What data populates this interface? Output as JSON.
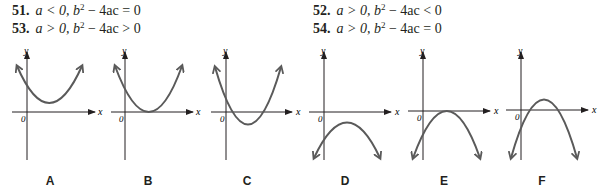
{
  "problems": [
    {
      "id": "p51",
      "number": "51.",
      "a_cond": "a < 0,",
      "disc": "b",
      "disc_rest": " − 4ac = 0"
    },
    {
      "id": "p52",
      "number": "52.",
      "a_cond": "a > 0,",
      "disc": "b",
      "disc_rest": " − 4ac < 0"
    },
    {
      "id": "p53",
      "number": "53.",
      "a_cond": "a > 0,",
      "disc": "b",
      "disc_rest": " − 4ac > 0"
    },
    {
      "id": "p54",
      "number": "54.",
      "a_cond": "a > 0,",
      "disc": "b",
      "disc_rest": " − 4ac = 0"
    }
  ],
  "graphs": [
    {
      "label": "A",
      "description": "opens upward, vertex above x-axis, no x-intercepts"
    },
    {
      "label": "B",
      "description": "opens upward, vertex on x-axis, one x-intercept"
    },
    {
      "label": "C",
      "description": "opens upward, vertex below x-axis, two x-intercepts"
    },
    {
      "label": "D",
      "description": "opens downward, vertex below x-axis, no x-intercepts"
    },
    {
      "label": "E",
      "description": "opens downward, vertex on x-axis, one x-intercept"
    },
    {
      "label": "F",
      "description": "opens downward, vertex above x-axis, two x-intercepts"
    }
  ],
  "axis_labels": {
    "x": "x",
    "y": "y",
    "origin": "0"
  },
  "colors": {
    "curve": "#5a5a5a",
    "axis": "#231f20",
    "text": "#231f20"
  }
}
